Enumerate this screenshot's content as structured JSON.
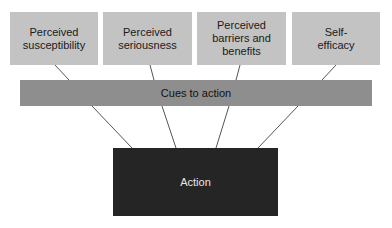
{
  "diagram": {
    "type": "flow-hierarchy",
    "top_factors": [
      {
        "label": "Perceived susceptibility"
      },
      {
        "label": "Perceived seriousness"
      },
      {
        "label": "Perceived barriers and benefits"
      },
      {
        "label": "Self-efficacy"
      }
    ],
    "middle": {
      "label": "Cues to action"
    },
    "bottom": {
      "label": "Action"
    },
    "colors": {
      "top_box_fill": "#c3c3c3",
      "middle_bar_fill": "#8e8e8e",
      "bottom_box_fill": "#252525",
      "bottom_text": "#e6e6e6",
      "connector": "#555555"
    },
    "edges": [
      {
        "from": "Perceived susceptibility",
        "to": "Cues to action"
      },
      {
        "from": "Perceived seriousness",
        "to": "Cues to action"
      },
      {
        "from": "Perceived barriers and benefits",
        "to": "Cues to action"
      },
      {
        "from": "Self-efficacy",
        "to": "Cues to action"
      },
      {
        "from": "Cues to action",
        "to": "Action"
      },
      {
        "from": "Cues to action",
        "to": "Action"
      },
      {
        "from": "Cues to action",
        "to": "Action"
      },
      {
        "from": "Cues to action",
        "to": "Action"
      }
    ]
  }
}
